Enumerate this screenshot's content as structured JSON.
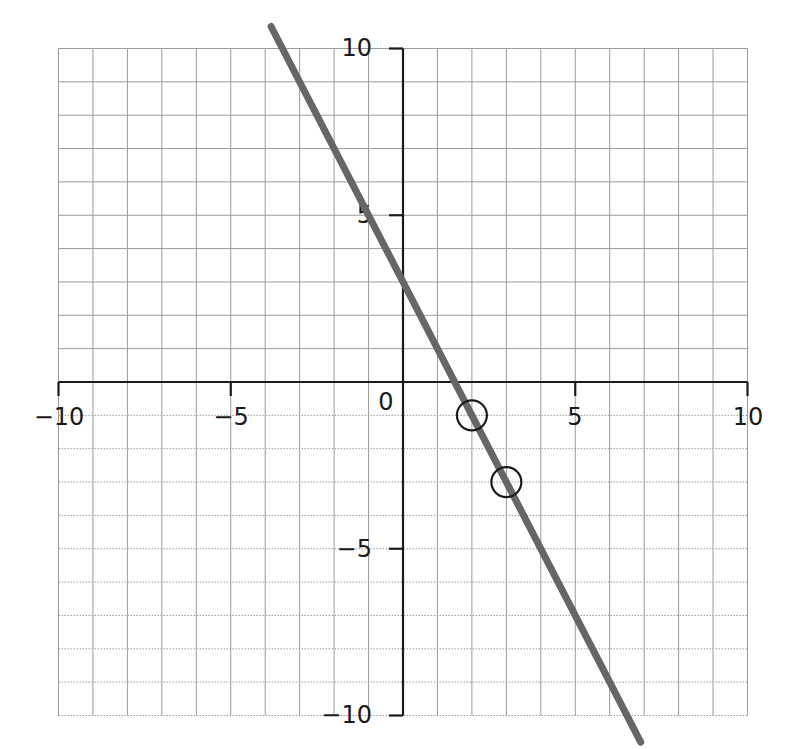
{
  "chart_data": {
    "type": "line",
    "title": "",
    "xlabel": "",
    "ylabel": "",
    "xlim": [
      -10,
      10
    ],
    "ylim": [
      -10,
      10
    ],
    "grid": true,
    "grid_step": 1,
    "x_ticks": [
      -10,
      -5,
      0,
      5,
      10
    ],
    "y_ticks": [
      -10,
      -5,
      5,
      10
    ],
    "x_tick_labels": [
      "−10",
      "−5",
      "5",
      "10"
    ],
    "y_tick_labels": [
      "10",
      "5",
      "−5",
      "−10"
    ],
    "origin_label": "0",
    "series": [
      {
        "name": "y = -2x + 3",
        "slope": -2,
        "intercept": 3,
        "x": [
          -3.83,
          6.9
        ],
        "y": [
          10.66,
          -10.8
        ],
        "color": "#666666"
      }
    ],
    "highlighted_points": [
      {
        "x": 2,
        "y": -1,
        "marker": "open-circle"
      },
      {
        "x": 3,
        "y": -3,
        "marker": "open-circle"
      }
    ]
  },
  "labels": {
    "x_neg10": "−10",
    "x_neg5": "−5",
    "x_5": "5",
    "x_10": "10",
    "y_10": "10",
    "y_5": "5",
    "y_neg5": "−5",
    "y_neg10": "−10",
    "origin": "0"
  },
  "colors": {
    "line": "#666666",
    "axis": "#1a1a1a",
    "grid": "#9a9a9a",
    "marker": "#1a1a1a"
  }
}
